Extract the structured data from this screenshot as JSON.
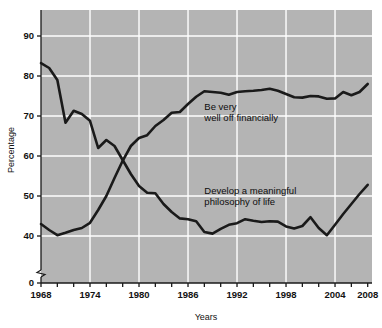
{
  "chart_data": {
    "type": "line",
    "title": "",
    "xlabel": "Years",
    "ylabel": "Percentage",
    "xlim": [
      1968,
      2008
    ],
    "ylim": [
      0,
      95
    ],
    "y_axis_break": true,
    "y_axis_break_between": [
      0,
      40
    ],
    "grid": true,
    "grid_color": "#ffffff",
    "plot_background": "#b4b4b4",
    "line_color": "#1a1a1a",
    "legend_position": "in-plot annotations",
    "x_ticks": [
      1968,
      1970,
      1972,
      1974,
      1976,
      1978,
      1980,
      1982,
      1984,
      1986,
      1988,
      1990,
      1992,
      1994,
      1996,
      1998,
      2000,
      2002,
      2004,
      2006,
      2008
    ],
    "x_tick_labels": [
      "1968",
      "",
      "",
      "1974",
      "",
      "",
      "1980",
      "",
      "",
      "1986",
      "",
      "",
      "1992",
      "",
      "",
      "1998",
      "",
      "",
      "2004",
      "",
      "2008"
    ],
    "x_major_labels": [
      "1968",
      "1974",
      "1980",
      "1986",
      "1992",
      "1998",
      "2004",
      "2008"
    ],
    "y_ticks": [
      0,
      40,
      50,
      60,
      70,
      80,
      90
    ],
    "y_tick_labels": [
      "0",
      "40",
      "50",
      "60",
      "70",
      "80",
      "90"
    ],
    "gridlines_y": [
      40,
      50,
      60,
      70,
      80,
      90
    ],
    "gridlines_x": [
      1974,
      1980,
      1986,
      1992,
      1998,
      2004
    ],
    "x": [
      1968,
      1969,
      1970,
      1971,
      1972,
      1973,
      1974,
      1975,
      1976,
      1977,
      1978,
      1979,
      1980,
      1981,
      1982,
      1983,
      1984,
      1985,
      1986,
      1987,
      1988,
      1989,
      1990,
      1991,
      1992,
      1993,
      1994,
      1995,
      1996,
      1997,
      1998,
      1999,
      2000,
      2001,
      2002,
      2003,
      2004,
      2005,
      2006,
      2007,
      2008
    ],
    "series": [
      {
        "name": "Be very well off financially",
        "label_line1": "Be very",
        "label_line2": "well off financially",
        "label_x": 1988,
        "label_y": 71.5,
        "values": [
          43.0,
          41.5,
          40.2,
          40.8,
          41.5,
          42.0,
          43.3,
          46.5,
          50.0,
          54.5,
          58.8,
          62.5,
          64.5,
          65.2,
          67.5,
          69.0,
          70.8,
          71.0,
          73.0,
          74.8,
          76.2,
          76.0,
          75.8,
          75.3,
          76.0,
          76.2,
          76.3,
          76.5,
          76.8,
          76.3,
          75.5,
          74.7,
          74.6,
          75.0,
          74.9,
          74.3,
          74.4,
          76.0,
          75.2,
          76.0,
          78.0
        ]
      },
      {
        "name": "Develop a meaningful philosophy of life",
        "label_line1": "Develop a meaningful",
        "label_line2": "philosophy of life",
        "label_x": 1988,
        "label_y": 50.5,
        "values": [
          83.2,
          82.0,
          79.0,
          68.3,
          71.3,
          70.5,
          68.8,
          62.0,
          64.0,
          62.5,
          59.0,
          55.5,
          52.5,
          50.8,
          50.7,
          48.0,
          46.0,
          44.4,
          44.2,
          43.7,
          41.0,
          40.6,
          41.8,
          42.8,
          43.2,
          44.2,
          43.8,
          43.5,
          43.7,
          43.6,
          42.4,
          41.9,
          42.5,
          44.7,
          42.0,
          40.2,
          42.8,
          45.5,
          48.0,
          50.5,
          52.8
        ]
      }
    ]
  },
  "axes": {
    "y_title": "Percentage",
    "x_title": "Years"
  }
}
